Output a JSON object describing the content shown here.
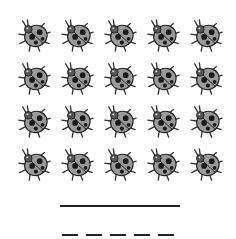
{
  "worksheet": {
    "item": "ladybug",
    "rows": 4,
    "columns": 5,
    "count": 20,
    "answer_line": "",
    "dash_blanks": 5
  },
  "colors": {
    "shell": "#9a9a9a",
    "spots": "#1a1a1a",
    "line": "#222222"
  }
}
